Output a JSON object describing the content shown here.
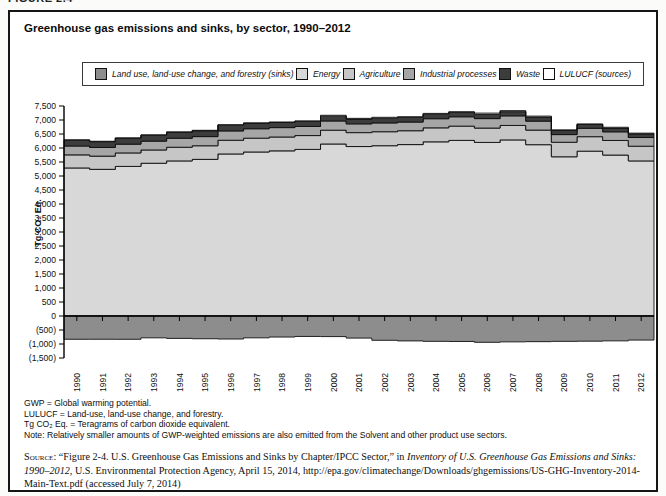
{
  "figure_label": "FIGURE 2.4",
  "panel": {
    "title": "Greenhouse gas emissions and sinks, by sector, 1990–2012"
  },
  "legend": {
    "items": [
      {
        "label": "Land use, land-use change, and forestry (sinks)",
        "color": "#8d8d8d"
      },
      {
        "label": "Energy",
        "color": "#d8d8d8"
      },
      {
        "label": "Agriculture",
        "color": "#c6c6c6"
      },
      {
        "label": "Industrial processes",
        "color": "#a6a6a6"
      },
      {
        "label": "Waste",
        "color": "#3c3c3c"
      },
      {
        "label": "LULUCF (sources)",
        "color": "#ffffff"
      }
    ]
  },
  "chart_data": {
    "type": "area",
    "stacked": true,
    "step": true,
    "title": "Greenhouse gas emissions and sinks, by sector, 1990–2012",
    "xlabel": "",
    "ylabel": "Tg CO₂ Eq.",
    "ylim": [
      -1500,
      7500
    ],
    "ytick_interval": 500,
    "y_tick_labels": [
      "7,500",
      "7,000",
      "6,500",
      "6,000",
      "5,500",
      "5,000",
      "4,500",
      "4,000",
      "3,500",
      "3,000",
      "2,500",
      "2,000",
      "1,500",
      "1,000",
      "500",
      "0",
      "(500)",
      "(1,000)",
      "(1,500)"
    ],
    "grid": false,
    "legend_position": "top",
    "years": [
      1990,
      1991,
      1992,
      1993,
      1994,
      1995,
      1996,
      1997,
      1998,
      1999,
      2000,
      2001,
      2002,
      2003,
      2004,
      2005,
      2006,
      2007,
      2008,
      2009,
      2010,
      2011,
      2012
    ],
    "series": [
      {
        "name": "Energy",
        "color": "#d8d8d8",
        "values": [
          5287,
          5238,
          5343,
          5455,
          5538,
          5594,
          5787,
          5858,
          5898,
          5950,
          6143,
          6052,
          6082,
          6122,
          6220,
          6272,
          6199,
          6289,
          6118,
          5686,
          5887,
          5748,
          5538
        ]
      },
      {
        "name": "Agriculture",
        "color": "#c6c6c6",
        "values": [
          468,
          472,
          481,
          475,
          489,
          486,
          490,
          493,
          495,
          494,
          493,
          497,
          499,
          495,
          500,
          509,
          513,
          516,
          522,
          519,
          517,
          521,
          526
        ]
      },
      {
        "name": "Industrial processes",
        "color": "#a6a6a6",
        "values": [
          316,
          309,
          313,
          315,
          322,
          327,
          333,
          336,
          335,
          327,
          329,
          313,
          315,
          310,
          326,
          334,
          338,
          343,
          319,
          274,
          300,
          309,
          310
        ]
      },
      {
        "name": "Waste",
        "color": "#3c3c3c",
        "values": [
          206,
          208,
          209,
          209,
          210,
          209,
          204,
          193,
          183,
          178,
          173,
          170,
          167,
          165,
          161,
          156,
          153,
          151,
          148,
          145,
          135,
          133,
          131
        ]
      },
      {
        "name": "LULUCF (sources)",
        "color": "#ffffff",
        "values": [
          14,
          14,
          15,
          15,
          16,
          16,
          17,
          18,
          18,
          19,
          30,
          27,
          33,
          25,
          29,
          25,
          43,
          36,
          32,
          25,
          22,
          30,
          26
        ]
      },
      {
        "name": "Land use, land-use change, and forestry (sinks)",
        "color": "#8d8d8d",
        "values": [
          -831,
          -830,
          -832,
          -780,
          -800,
          -812,
          -822,
          -780,
          -752,
          -730,
          -735,
          -790,
          -868,
          -890,
          -905,
          -910,
          -940,
          -924,
          -916,
          -906,
          -900,
          -888,
          -860
        ]
      }
    ]
  },
  "footnotes": [
    "GWP = Global warming potential.",
    "LULUCF = Land-use, land-use change, and forestry.",
    "Tg CO₂ Eq. = Teragrams of carbon dioxide equivalent.",
    "Note: Relatively smaller amounts of GWP-weighted emissions are also emitted from the Solvent and other product use sectors."
  ],
  "source": {
    "label": "Source:",
    "before_italic": "“Figure 2-4. U.S. Greenhouse Gas Emissions and Sinks by Chapter/IPCC Sector,” in ",
    "italic": "Inventory of U.S. Greenhouse Gas Emissions and Sinks: 1990–2012",
    "after_italic": ", U.S. Environmental Protection Agency, April 15, 2014, http://epa.gov/climatechange/Downloads/ghgemissions/US-GHG-Inventory-2014-Main-Text.pdf (accessed July 7, 2014)"
  }
}
